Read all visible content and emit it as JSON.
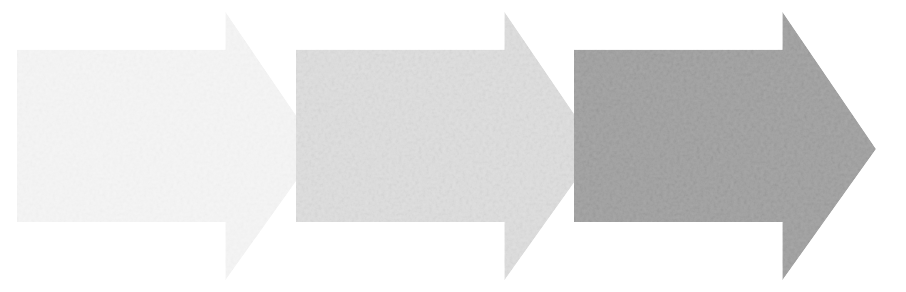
{
  "canvas": {
    "width": 906,
    "height": 292,
    "background_color": "#ffffff",
    "description": "Three right-pointing block arrows in a horizontal row, rendered with a fine grainy noise texture, increasing in darkness from left to right on a plain white background."
  },
  "shape": {
    "name": "block-arrow-right",
    "direction": "right",
    "count": 3,
    "texture": "fine-grain-noise",
    "outline": "none",
    "geometry": {
      "tail_top_pct": 17,
      "tail_bottom_pct": 76,
      "notch_x_pct": 69,
      "head_top_pct": 4,
      "head_bottom_pct": 96,
      "tip_x_pct": 100,
      "tip_y_pct": 51
    }
  },
  "arrows": [
    {
      "id": "arrow-1",
      "order": 1,
      "label": "lightest",
      "fill_color": "#f5f5f5",
      "noise_opacity": 0.1,
      "left": 17,
      "top": 0,
      "width": 302,
      "height": 292
    },
    {
      "id": "arrow-2",
      "order": 2,
      "label": "medium-light",
      "fill_color": "#e0e0e0",
      "noise_opacity": 0.22,
      "left": 296,
      "top": 0,
      "width": 302,
      "height": 292
    },
    {
      "id": "arrow-3",
      "order": 3,
      "label": "medium-dark",
      "fill_color": "#a8a8a8",
      "noise_opacity": 0.34,
      "left": 574,
      "top": 0,
      "width": 302,
      "height": 292
    }
  ]
}
